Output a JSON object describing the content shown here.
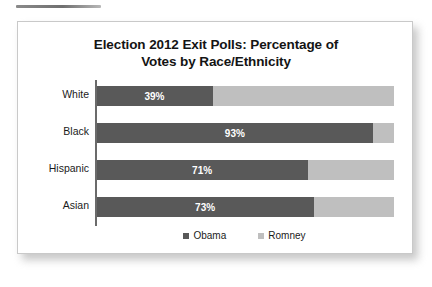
{
  "document": {
    "top_rule": "horizontal-rule"
  },
  "chart_data": {
    "type": "bar",
    "subtype": "stacked-horizontal-100",
    "title": "Election 2012 Exit Polls: Percentage of",
    "title_line2": "Votes by Race/Ethnicity",
    "title_full": "Election 2012 Exit Polls: Percentage of Votes by Race/Ethnicity",
    "xlabel": "",
    "ylabel": "",
    "xlim": [
      0,
      100
    ],
    "grid": false,
    "legend_position": "bottom",
    "categories": [
      "White",
      "Black",
      "Hispanic",
      "Asian"
    ],
    "series": [
      {
        "name": "Obama",
        "color": "#595959",
        "values": [
          39,
          93,
          71,
          73
        ],
        "labels": [
          "39%",
          "93%",
          "71%",
          "73%"
        ]
      },
      {
        "name": "Romney",
        "color": "#bfbfbf",
        "values": [
          61,
          7,
          29,
          27
        ],
        "labels": [
          "",
          "",
          "",
          ""
        ]
      }
    ],
    "legend": [
      {
        "label": "Obama",
        "color": "#595959"
      },
      {
        "label": "Romney",
        "color": "#bfbfbf"
      }
    ],
    "rows": [
      {
        "category": "White",
        "obama": 39,
        "romney": 61,
        "obama_label": "39%"
      },
      {
        "category": "Black",
        "obama": 93,
        "romney": 7,
        "obama_label": "93%"
      },
      {
        "category": "Hispanic",
        "obama": 71,
        "romney": 29,
        "obama_label": "71%"
      },
      {
        "category": "Asian",
        "obama": 73,
        "romney": 27,
        "obama_label": "73%"
      }
    ]
  }
}
